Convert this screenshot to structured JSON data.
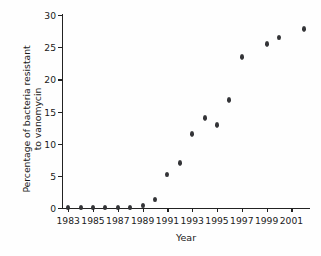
{
  "chart_data": {
    "type": "scatter",
    "title": "",
    "xlabel": "Year",
    "ylabel_line1": "Percentage of bacteria resistant",
    "ylabel_line2": "to vanomycin",
    "ylabel": "Percentage of bacteria resistant to vanomycin",
    "grid": false,
    "legend": "none",
    "xlim": [
      1982.5,
      2002.5
    ],
    "ylim": [
      0,
      30
    ],
    "x_tick_labels": [
      "1983",
      "1985",
      "1987",
      "1989",
      "1991",
      "1993",
      "1995",
      "1997",
      "1999",
      "2001"
    ],
    "x_tick_values": [
      1983,
      1985,
      1987,
      1989,
      1991,
      1993,
      1995,
      1997,
      1999,
      2001
    ],
    "y_tick_labels": [
      "0",
      "5",
      "10",
      "15",
      "20",
      "25",
      "30"
    ],
    "y_tick_values": [
      0,
      5,
      10,
      15,
      20,
      25,
      30
    ],
    "x": [
      1983,
      1984,
      1985,
      1986,
      1987,
      1988,
      1989,
      1990,
      1991,
      1992,
      1993,
      1994,
      1995,
      1996,
      1997,
      1999,
      2000,
      2002
    ],
    "values": [
      0.1,
      0.1,
      0.1,
      0.1,
      0.1,
      0.1,
      0.4,
      1.3,
      5.2,
      7.0,
      11.5,
      14.0,
      12.9,
      16.8,
      23.5,
      25.5,
      26.5,
      27.8
    ],
    "marker_color": "#333437",
    "axis_color": "#222222",
    "background_color": "#fefefe"
  }
}
